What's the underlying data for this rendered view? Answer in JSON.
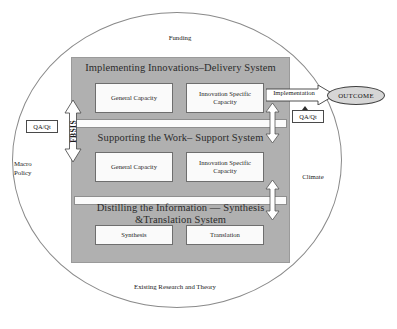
{
  "diagram": {
    "environment_labels": {
      "top": "Funding",
      "right": "Climate",
      "left": "Macro\nPolicy",
      "left_line1": "Macro",
      "left_line2": "Policy",
      "bottom": "Existing Research and Theory"
    },
    "sections": [
      {
        "id": "delivery",
        "title": "Implementing Innovations–Delivery System",
        "boxes": [
          {
            "label": "General Capacity"
          },
          {
            "label": "Innovation Specific Capacity"
          }
        ]
      },
      {
        "id": "support",
        "title": "Supporting the Work– Support System",
        "boxes": [
          {
            "label": "General Capacity"
          },
          {
            "label": "Innovation Specific Capacity"
          }
        ]
      },
      {
        "id": "synthesis",
        "title": "Distilling the Information — Synthesis &Translation System",
        "title_line1": "Distilling the Information — Synthesis",
        "title_line2": "&Translation System",
        "boxes": [
          {
            "label": "Synthesis"
          },
          {
            "label": "Translation"
          }
        ]
      }
    ],
    "connectors": {
      "implementation_arrow": "Implementation",
      "outcome": "OUTCOME",
      "feedback_label": "FBSIS",
      "qa_left": "QA/Qt",
      "qa_right": "QA/Qt"
    },
    "colors": {
      "panel_gray": "#b0b0b0",
      "box_white": "#fafafa",
      "outcome_fill": "#d6d6d6",
      "outline": "#8a8a8a",
      "text": "#1a1a1a"
    }
  }
}
